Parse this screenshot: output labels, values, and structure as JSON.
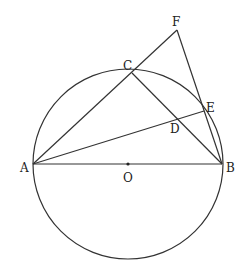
{
  "diagram": {
    "type": "geometry",
    "circle": {
      "center": "O",
      "cx": 128,
      "cy": 164,
      "r": 95
    },
    "points": {
      "A": {
        "label": "A",
        "x": 33,
        "y": 164
      },
      "B": {
        "label": "B",
        "x": 222,
        "y": 164
      },
      "O": {
        "label": "O",
        "x": 128,
        "y": 164
      },
      "C": {
        "label": "C",
        "x": 132,
        "y": 73
      },
      "D": {
        "label": "D",
        "x": 176,
        "y": 118
      },
      "E": {
        "label": "E",
        "x": 204,
        "y": 111
      },
      "F": {
        "label": "F",
        "x": 177,
        "y": 30
      }
    },
    "segments": [
      "AB",
      "AF",
      "CB",
      "AE",
      "FB"
    ]
  }
}
